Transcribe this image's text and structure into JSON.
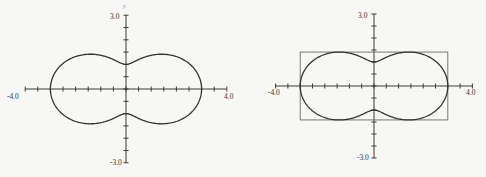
{
  "chart_data": [
    {
      "type": "line",
      "title": "",
      "description": "Polar curve r = 2 + cos(2θ) plotted in Cartesian plane",
      "equation": "r = 2 + cos(2θ)",
      "xlabel": "",
      "ylabel": "y",
      "xlim": [
        -4.0,
        4.0
      ],
      "ylim": [
        -3.0,
        3.0
      ],
      "x_tick_labels": [
        "-4.0",
        "4.0"
      ],
      "y_tick_labels": [
        "3.0",
        "-3.0"
      ],
      "tick_step": 0.5,
      "grid": false,
      "key_points": {
        "x_intercepts": [
          -3.0,
          3.0
        ],
        "y_intercepts": [
          -1.0,
          1.0
        ],
        "max_y": 1.414,
        "min_y": -1.414
      },
      "bounding_box": null,
      "px": {
        "x0": 126,
        "y0": 89,
        "sx": 25.2,
        "sy": 24.6
      }
    },
    {
      "type": "line",
      "title": "",
      "description": "Same polar curve with enclosing bounding rectangle",
      "equation": "r = 2 + cos(2θ)",
      "xlabel": "",
      "ylabel": "",
      "xlim": [
        -4.0,
        4.0
      ],
      "ylim": [
        -3.0,
        3.0
      ],
      "x_tick_labels": [
        "-4.0",
        "4.0"
      ],
      "y_tick_labels": [
        "3.0",
        "-3.0"
      ],
      "tick_step": 0.5,
      "grid": false,
      "key_points": {
        "x_intercepts": [
          -3.0,
          3.0
        ],
        "y_intercepts": [
          -1.0,
          1.0
        ],
        "max_y": 1.414,
        "min_y": -1.414
      },
      "bounding_box": {
        "xmin": -3.0,
        "xmax": 3.0,
        "ymin": -1.414,
        "ymax": 1.414
      },
      "px": {
        "x0": 374,
        "y0": 86,
        "sx": 24.6,
        "sy": 24.0
      }
    }
  ],
  "labels": {
    "left": {
      "xmin": "-4.0",
      "xmax": "4.0",
      "ymax": "3.0",
      "ymin": "-3.0",
      "yaxis": "y"
    },
    "right": {
      "xmin": "-4.0",
      "xmax": "4.0",
      "ymax": "3.0",
      "ymin": "-3.0"
    }
  }
}
